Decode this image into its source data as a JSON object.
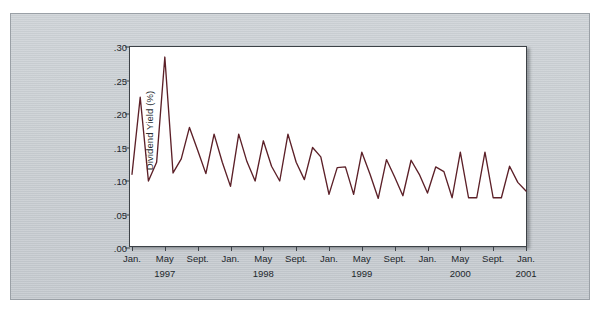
{
  "figure": {
    "caption_sliver": "",
    "background_color": "#ffffff",
    "panel_color": "#c8cdd1"
  },
  "chart_data": {
    "type": "line",
    "title": "",
    "subtitle": "",
    "xlabel": "",
    "ylabel": "Dividend Yield (%)",
    "line_color": "#5c2028",
    "grid": false,
    "legend": "none",
    "ylim": [
      0.0,
      0.3
    ],
    "ytick_values": [
      0.0,
      0.05,
      0.1,
      0.15,
      0.2,
      0.25,
      0.3
    ],
    "ytick_labels": [
      ".00",
      ".05",
      ".10",
      ".15",
      ".20",
      ".25",
      ".30"
    ],
    "xtick_labels": [
      "Jan.",
      "May",
      "Sept.",
      "Jan.",
      "May",
      "Sept.",
      "Jan.",
      "May",
      "Sept.",
      "Jan.",
      "May",
      "Sept.",
      "Jan."
    ],
    "xtick_months": [
      0,
      4,
      8,
      12,
      16,
      20,
      24,
      28,
      32,
      36,
      40,
      44,
      48
    ],
    "year_labels": [
      {
        "label": "1997",
        "month_index": 4
      },
      {
        "label": "1998",
        "month_index": 16
      },
      {
        "label": "1999",
        "month_index": 28
      },
      {
        "label": "2000",
        "month_index": 40
      },
      {
        "label": "2001",
        "month_index": 48
      }
    ],
    "x": [
      "Jan. 1997",
      "Feb. 1997",
      "Mar. 1997",
      "Apr. 1997",
      "May 1997",
      "June 1997",
      "July 1997",
      "Aug. 1997",
      "Sept. 1997",
      "Oct. 1997",
      "Nov. 1997",
      "Dec. 1997",
      "Jan. 1998",
      "Feb. 1998",
      "Mar. 1998",
      "Apr. 1998",
      "May 1998",
      "June 1998",
      "July 1998",
      "Aug. 1998",
      "Sept. 1998",
      "Oct. 1998",
      "Nov. 1998",
      "Dec. 1998",
      "Jan. 1999",
      "Feb. 1999",
      "Mar. 1999",
      "Apr. 1999",
      "May 1999",
      "June 1999",
      "July 1999",
      "Aug. 1999",
      "Sept. 1999",
      "Oct. 1999",
      "Nov. 1999",
      "Dec. 1999",
      "Jan. 2000",
      "Feb. 2000",
      "Mar. 2000",
      "Apr. 2000",
      "May 2000",
      "June 2000",
      "July 2000",
      "Aug. 2000",
      "Sept. 2000",
      "Oct. 2000",
      "Nov. 2000",
      "Dec. 2000",
      "Jan. 2001"
    ],
    "values": [
      0.11,
      0.225,
      0.1,
      0.128,
      0.285,
      0.112,
      0.133,
      0.18,
      0.146,
      0.111,
      0.17,
      0.128,
      0.092,
      0.17,
      0.129,
      0.1,
      0.16,
      0.122,
      0.1,
      0.17,
      0.128,
      0.102,
      0.15,
      0.136,
      0.08,
      0.12,
      0.121,
      0.08,
      0.143,
      0.11,
      0.074,
      0.132,
      0.106,
      0.078,
      0.131,
      0.11,
      0.082,
      0.121,
      0.114,
      0.075,
      0.143,
      0.075,
      0.075,
      0.143,
      0.075,
      0.075,
      0.122,
      0.098,
      0.085
    ],
    "n_points": 49,
    "x_range_label": "Jan. 1997 to Jan. 2001"
  }
}
